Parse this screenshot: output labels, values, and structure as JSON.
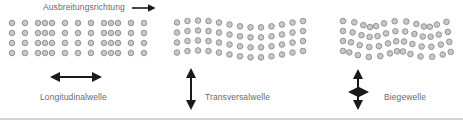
{
  "diagram": {
    "propagation_label": "Ausbreitungsrichtung",
    "waves": [
      {
        "id": "longitudinal",
        "label": "Longitudinalwelle",
        "motion": "horizontal"
      },
      {
        "id": "transversal",
        "label": "Transversalwelle",
        "motion": "vertical"
      },
      {
        "id": "bending",
        "label": "Biegewelle",
        "motion": "horizontal-and-vertical"
      }
    ],
    "icons": {
      "propagation": "arrow-right-icon",
      "longitudinal": "double-arrow-horizontal-icon",
      "transversal": "double-arrow-vertical-icon",
      "bending": "four-way-arrow-icon"
    },
    "colors": {
      "particle_fill": "#c8c8c8",
      "particle_stroke": "#8a8a8a",
      "arrow": "#1a1a1a",
      "text": "#6b6b6b",
      "divider": "#d4d4d4"
    }
  }
}
